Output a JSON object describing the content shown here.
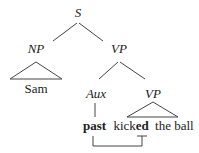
{
  "diagram": {
    "type": "syntax-tree",
    "nodes": {
      "root": "S",
      "subject": "NP",
      "predicate": "VP",
      "aux": "Aux",
      "inner_vp": "VP"
    },
    "leaves": {
      "subject_word": "Sam",
      "tense_marker": "past",
      "verb_stem": "kick",
      "verb_suffix": "ed",
      "object_phrase": "the ball"
    },
    "colors": {
      "line": "#444444",
      "text": "#222222",
      "background": "#ffffff"
    }
  }
}
